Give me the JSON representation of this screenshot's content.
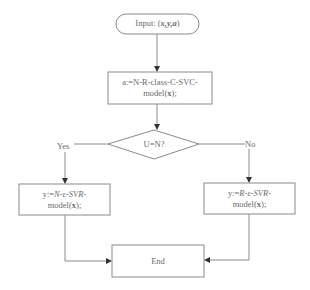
{
  "flowchart": {
    "start": {
      "prefix": "Input: (",
      "vars": "x,y,a",
      "suffix": ")"
    },
    "classify": {
      "line1": "a:=N-R-class-C-SVC-",
      "line2a": "model(",
      "line2b": "x",
      "line2c": ");"
    },
    "decision": {
      "label": "U=N?"
    },
    "branch_yes": {
      "label": "Yes",
      "line1a": "y:=",
      "line1b": "N-ε-SVR",
      "line1c": "-",
      "line2a": "model(",
      "line2b": "x",
      "line2c": ");"
    },
    "branch_no": {
      "label": "No",
      "line1a": "y:=",
      "line1b": "R-ε-SVR",
      "line1c": "-",
      "line2a": "model(",
      "line2b": "x",
      "line2c": ");"
    },
    "end": {
      "label": "End"
    }
  },
  "colors": {
    "stroke": "#8a8a8a",
    "text": "#6a6a6a",
    "arrow": "#333333"
  }
}
